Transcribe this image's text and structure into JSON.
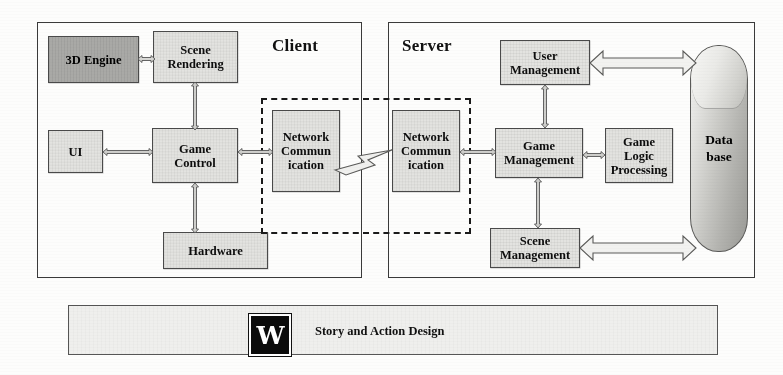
{
  "figure": {
    "type": "block-diagram"
  },
  "client": {
    "title": "Client",
    "nodes": {
      "engine_3d": "3D Engine",
      "scene_rendering_line1": "Scene",
      "scene_rendering_line2": "Rendering",
      "ui": "UI",
      "game_control_line1": "Game",
      "game_control_line2": "Control",
      "hardware": "Hardware",
      "network_comm_line1": "Network",
      "network_comm_line2": "Commun",
      "network_comm_line3": "ication"
    }
  },
  "server": {
    "title": "Server",
    "nodes": {
      "network_comm_line1": "Network",
      "network_comm_line2": "Commun",
      "network_comm_line3": "ication",
      "user_management_line1": "User",
      "user_management_line2": "Management",
      "game_management_line1": "Game",
      "game_management_line2": "Management",
      "game_logic_line1": "Game",
      "game_logic_line2": "Logic",
      "game_logic_line3": "Processing",
      "scene_management_line1": "Scene",
      "scene_management_line2": "Management",
      "database_line1": "Data",
      "database_line2": "base"
    }
  },
  "network_group": {
    "link_icon": "lightning-bolt"
  },
  "bottom_bar": {
    "logo_letter": "W",
    "label": "Story and Action Design"
  },
  "colors": {
    "node_fill": "#e3e3e0",
    "node_dark_fill": "#a9a9a6",
    "border": "#4a4a4a",
    "frame_border": "#3a3a3a",
    "text": "#0d0d0d",
    "cylinder_light": "#f3f3f1",
    "cylinder_dark": "#9b9b97",
    "logo_bg": "#0b0b0b"
  }
}
